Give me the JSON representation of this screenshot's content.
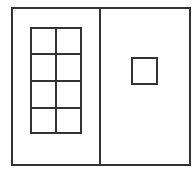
{
  "diagram": {
    "stroke_color": "#333333",
    "background_color": "#ffffff",
    "left_panel": {
      "shape": "grid",
      "columns": 2,
      "rows": 4
    },
    "right_panel": {
      "shape": "square",
      "count": 1
    }
  }
}
